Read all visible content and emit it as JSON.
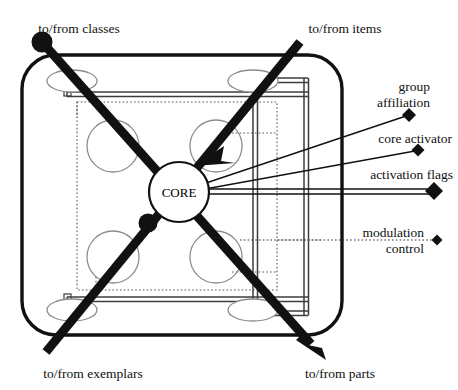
{
  "diagram": {
    "colors": {
      "background": "#ffffff",
      "outline": "#111111",
      "rail": "#3d3d3d",
      "circle_outline": "#8d8d8d",
      "dotted": "#555555",
      "text": "#101010"
    },
    "core": {
      "label": "CORE",
      "cx": 179,
      "cy": 192,
      "r": 30
    },
    "edge_labels": [
      {
        "id": "classes",
        "text": "to/from classes",
        "x": 79,
        "y": 33,
        "anchor": "middle"
      },
      {
        "id": "items",
        "text": "to/from items",
        "x": 345,
        "y": 33,
        "anchor": "middle"
      },
      {
        "id": "exemplars",
        "text": "to/from exemplars",
        "x": 93,
        "y": 378,
        "anchor": "middle"
      },
      {
        "id": "parts",
        "text": "to/from parts",
        "x": 340,
        "y": 378,
        "anchor": "middle"
      }
    ],
    "port_labels": [
      {
        "id": "group-affiliation",
        "lines": [
          "group",
          "affiliation"
        ],
        "x": 430,
        "y": 90,
        "anchor": "end",
        "marker": {
          "x": 409,
          "y": 115,
          "size": 7
        },
        "line": {
          "x1": 203,
          "y1": 184,
          "x2": 406,
          "y2": 116
        },
        "style": "thin"
      },
      {
        "id": "core-activator",
        "lines": [
          "core activator"
        ],
        "x": 452,
        "y": 142,
        "anchor": "end",
        "marker": {
          "x": 418,
          "y": 150,
          "size": 6.5
        },
        "line": {
          "x1": 205,
          "y1": 189,
          "x2": 415,
          "y2": 151
        },
        "style": "thin"
      },
      {
        "id": "activation-flags",
        "lines": [
          "activation flags"
        ],
        "x": 452,
        "y": 178,
        "anchor": "end",
        "marker": {
          "x": 434,
          "y": 191,
          "size": 9
        },
        "line": {
          "x1": 209,
          "y1": 191,
          "x2": 430,
          "y2": 191
        },
        "style": "rail"
      },
      {
        "id": "modulation-control",
        "lines": [
          "modulation",
          "control"
        ],
        "x": 424,
        "y": 236,
        "anchor": "end",
        "marker": {
          "x": 437,
          "y": 240,
          "size": 5.5
        },
        "line": {
          "x1": 240,
          "y1": 240,
          "x2": 433,
          "y2": 240
        },
        "style": "dotted"
      }
    ],
    "hub_nodes": [
      {
        "id": "classes-terminal",
        "cx": 42,
        "cy": 42,
        "r": 10.5
      },
      {
        "id": "exemplars-junction",
        "cx": 148,
        "cy": 223,
        "r": 9.5
      }
    ],
    "sub_circles": [
      {
        "id": "sub-circle-top-left",
        "cx": 113,
        "cy": 146,
        "r": 26
      },
      {
        "id": "sub-circle-top-right",
        "cx": 216,
        "cy": 146,
        "r": 26
      },
      {
        "id": "sub-circle-bottom-left",
        "cx": 113,
        "cy": 257,
        "r": 26
      },
      {
        "id": "sub-circle-bottom-right",
        "cx": 216,
        "cy": 257,
        "r": 26
      }
    ],
    "ellipses": [
      {
        "id": "ellipse-top-left",
        "cx": 72,
        "cy": 81,
        "rx": 25,
        "ry": 11
      },
      {
        "id": "ellipse-top-right",
        "cx": 253,
        "cy": 81,
        "rx": 25,
        "ry": 11
      },
      {
        "id": "ellipse-bottom-left",
        "cx": 72,
        "cy": 310,
        "rx": 25,
        "ry": 11
      },
      {
        "id": "ellipse-bottom-right",
        "cx": 253,
        "cy": 310,
        "rx": 25,
        "ry": 11
      }
    ],
    "diagonals": [
      {
        "id": "classes-to-parts",
        "from": "classes",
        "to": "parts",
        "x1": 42,
        "y1": 42,
        "x2": 322,
        "y2": 354,
        "arrow": "end"
      },
      {
        "id": "items-to-exemplars",
        "from": "items",
        "to": "exemplars",
        "x1": 300,
        "y1": 42,
        "x2": 45,
        "y2": 352,
        "arrow": "mid"
      }
    ],
    "frame": {
      "x": 22,
      "y": 55,
      "width": 320,
      "height": 280,
      "radius": 34
    }
  }
}
